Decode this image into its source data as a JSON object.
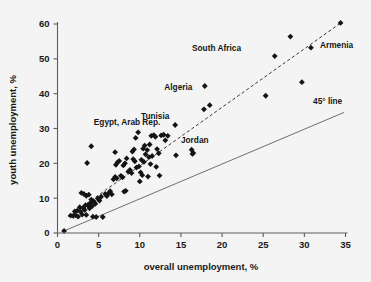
{
  "figure": {
    "background_color": "#f4f4f4",
    "marker_color": "#141414",
    "axis_color": "#5d5d5d",
    "fit_line_color": "#3a3a3a",
    "ref_line_color": "#6f6f6f"
  },
  "chart_data": {
    "type": "scatter",
    "title": "",
    "subtitle": "",
    "xlabel": "overall unemployment, %",
    "ylabel": "youth unemployment, %",
    "xlim": [
      0,
      35
    ],
    "ylim": [
      0,
      60
    ],
    "xticks": [
      0,
      5,
      10,
      15,
      20,
      25,
      30,
      35
    ],
    "yticks": [
      0,
      10,
      20,
      30,
      40,
      50,
      60
    ],
    "xtick_labels": [
      "0",
      "5",
      "10",
      "15",
      "20",
      "25",
      "30",
      "35"
    ],
    "ytick_labels": [
      "0",
      "10",
      "20",
      "30",
      "40",
      "50",
      "60"
    ],
    "grid": false,
    "legend": false,
    "legend_position": "none",
    "marker_shape": "diamond",
    "series": [
      {
        "name": "countries",
        "points": [
          [
            0.8,
            0.6
          ],
          [
            1.6,
            5.0
          ],
          [
            1.9,
            4.9
          ],
          [
            2.2,
            5.1
          ],
          [
            2.5,
            4.7
          ],
          [
            2.1,
            6.2
          ],
          [
            2.4,
            6.4
          ],
          [
            2.8,
            6.1
          ],
          [
            3.0,
            5.3
          ],
          [
            2.7,
            7.4
          ],
          [
            3.1,
            7.2
          ],
          [
            3.3,
            6.6
          ],
          [
            3.5,
            5.2
          ],
          [
            3.4,
            8.0
          ],
          [
            3.7,
            7.9
          ],
          [
            3.9,
            7.1
          ],
          [
            4.0,
            8.6
          ],
          [
            4.2,
            7.7
          ],
          [
            4.1,
            9.6
          ],
          [
            4.4,
            9.1
          ],
          [
            4.6,
            8.4
          ],
          [
            4.3,
            4.7
          ],
          [
            4.7,
            4.6
          ],
          [
            3.6,
            20.1
          ],
          [
            4.1,
            24.9
          ],
          [
            2.9,
            11.5
          ],
          [
            3.2,
            11.2
          ],
          [
            3.5,
            10.7
          ],
          [
            3.8,
            11.0
          ],
          [
            4.9,
            9.9
          ],
          [
            5.1,
            9.3
          ],
          [
            5.3,
            10.4
          ],
          [
            5.5,
            4.6
          ],
          [
            5.8,
            11.2
          ],
          [
            6.0,
            10.6
          ],
          [
            6.2,
            11.4
          ],
          [
            6.4,
            12.0
          ],
          [
            6.6,
            11.1
          ],
          [
            6.8,
            15.4
          ],
          [
            7.0,
            16.1
          ],
          [
            7.2,
            15.7
          ],
          [
            7.1,
            19.6
          ],
          [
            7.3,
            20.3
          ],
          [
            7.5,
            20.7
          ],
          [
            7.0,
            23.2
          ],
          [
            7.7,
            16.4
          ],
          [
            7.9,
            16.0
          ],
          [
            8.1,
            11.9
          ],
          [
            8.3,
            12.1
          ],
          [
            8.0,
            19.4
          ],
          [
            8.2,
            20.0
          ],
          [
            8.4,
            21.4
          ],
          [
            8.6,
            17.6
          ],
          [
            8.8,
            18.1
          ],
          [
            9.0,
            17.2
          ],
          [
            9.2,
            21.2
          ],
          [
            9.4,
            20.6
          ],
          [
            9.1,
            23.4
          ],
          [
            9.3,
            24.0
          ],
          [
            9.5,
            27.3
          ],
          [
            9.8,
            28.9
          ],
          [
            9.6,
            18.8
          ],
          [
            9.9,
            19.1
          ],
          [
            10.1,
            17.4
          ],
          [
            10.3,
            16.6
          ],
          [
            10.0,
            14.8
          ],
          [
            10.2,
            21.0
          ],
          [
            10.5,
            20.4
          ],
          [
            10.7,
            22.6
          ],
          [
            10.4,
            24.2
          ],
          [
            10.6,
            25.1
          ],
          [
            10.9,
            23.8
          ],
          [
            11.1,
            21.8
          ],
          [
            11.3,
            19.8
          ],
          [
            11.5,
            22.1
          ],
          [
            11.2,
            25.4
          ],
          [
            11.4,
            27.9
          ],
          [
            11.7,
            28.1
          ],
          [
            11.9,
            27.6
          ],
          [
            12.1,
            24.1
          ],
          [
            12.3,
            22.9
          ],
          [
            12.0,
            19.0
          ],
          [
            12.6,
            28.0
          ],
          [
            12.9,
            28.2
          ],
          [
            13.1,
            26.6
          ],
          [
            13.4,
            27.9
          ],
          [
            12.4,
            16.5
          ],
          [
            11.0,
            16.2
          ],
          [
            14.3,
            31.0
          ],
          [
            14.4,
            22.3
          ],
          [
            16.3,
            23.9
          ],
          [
            16.5,
            23.0
          ],
          [
            16.4,
            22.7
          ],
          [
            17.8,
            35.5
          ],
          [
            18.5,
            36.7
          ],
          [
            17.9,
            42.2
          ],
          [
            25.3,
            39.4
          ],
          [
            26.4,
            50.8
          ],
          [
            28.3,
            56.4
          ],
          [
            29.7,
            43.3
          ],
          [
            30.8,
            53.2
          ],
          [
            34.4,
            60.3
          ]
        ]
      }
    ],
    "annotations": [
      {
        "text": "South Africa",
        "x": 22.3,
        "y": 52.2,
        "align": "end"
      },
      {
        "text": "Armenia",
        "x": 31.9,
        "y": 53.0,
        "align": "start"
      },
      {
        "text": "Algeria",
        "x": 16.4,
        "y": 41.0,
        "align": "end"
      },
      {
        "text": "Tunisia",
        "x": 13.6,
        "y": 32.8,
        "align": "end"
      },
      {
        "text": "Egypt, Arab Rep.",
        "x": 12.5,
        "y": 31.1,
        "align": "end"
      },
      {
        "text": "Jordan",
        "x": 15.0,
        "y": 25.7,
        "align": "start"
      },
      {
        "text": "45° line",
        "x": 34.6,
        "y": 37.0,
        "align": "end"
      }
    ],
    "reference_lines": [
      {
        "name": "45-degree-line",
        "label": "45° line",
        "style": "solid",
        "x0": 0.8,
        "y0": 0.6,
        "x1": 34.8,
        "y1": 34.6
      },
      {
        "name": "fit-line",
        "label": "",
        "style": "dashed",
        "x0": 1.3,
        "y0": 4.7,
        "x1": 34.6,
        "y1": 60.6
      }
    ]
  }
}
